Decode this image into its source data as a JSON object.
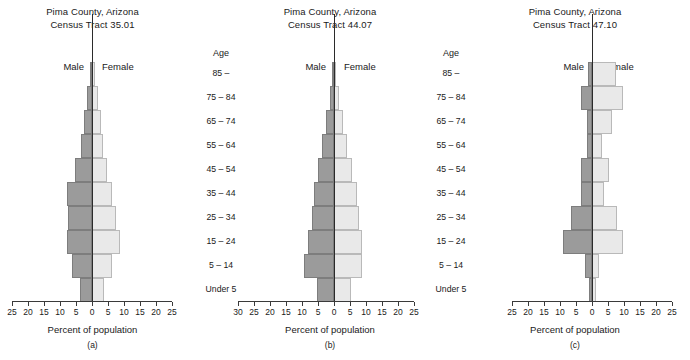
{
  "figure": {
    "axis_title": "Percent of population",
    "age_header": "Age",
    "male_label": "Male",
    "female_label": "Female",
    "age_groups": [
      "85 –",
      "75 – 84",
      "65 – 74",
      "55 – 64",
      "45 – 54",
      "35 – 44",
      "25 – 34",
      "15 – 24",
      "5 – 14",
      "Under 5"
    ],
    "colors": {
      "male_bar": "#9b9b9b",
      "female_bar": "#e9e9e9",
      "axis": "#3a3a3a",
      "text": "#1a1a1a"
    }
  },
  "panels": [
    {
      "key": "a",
      "caption": "(a)",
      "title_line1": "Pima County, Arizona",
      "title_line2": "Census Tract 35.01",
      "ticks": [
        25,
        20,
        15,
        10,
        5,
        0,
        5,
        10,
        15,
        20,
        25
      ]
    },
    {
      "key": "b",
      "caption": "(b)",
      "title_line1": "Pima County, Arizona",
      "title_line2": "Census Tract 44.07",
      "ticks": [
        30,
        25,
        20,
        15,
        10,
        5,
        0,
        5,
        10,
        15,
        20,
        25
      ]
    },
    {
      "key": "c",
      "caption": "(c)",
      "title_line1": "Pima County, Arizona",
      "title_line2": "Census Tract 47.10",
      "ticks": [
        25,
        20,
        15,
        10,
        5,
        0,
        5,
        10,
        15,
        20,
        25
      ]
    }
  ],
  "chart_data": [
    {
      "type": "bar",
      "chart_style": "population-pyramid",
      "panel": "a",
      "title": "Pima County, Arizona Census Tract 35.01",
      "xlabel": "Percent of population",
      "ylabel": "Age",
      "xlim": [
        -25,
        25
      ],
      "xticks": [
        25,
        20,
        15,
        10,
        5,
        0,
        5,
        10,
        15,
        20,
        25
      ],
      "grid": false,
      "legend": "inline labels Male (left) / Female (right)",
      "categories": [
        "85 –",
        "75 – 84",
        "65 – 74",
        "55 – 64",
        "45 – 54",
        "35 – 44",
        "25 – 34",
        "15 – 24",
        "5 – 14",
        "Under 5"
      ],
      "series": [
        {
          "name": "Male",
          "side": "left",
          "values": [
            0.6,
            1.5,
            2.6,
            3.3,
            5.4,
            7.8,
            7.6,
            7.7,
            6.1,
            3.6
          ]
        },
        {
          "name": "Female",
          "side": "right",
          "values": [
            1.0,
            1.9,
            2.8,
            3.5,
            4.6,
            6.1,
            7.6,
            8.6,
            6.2,
            3.8
          ]
        }
      ]
    },
    {
      "type": "bar",
      "chart_style": "population-pyramid",
      "panel": "b",
      "title": "Pima County, Arizona Census Tract 44.07",
      "xlabel": "Percent of population",
      "ylabel": "Age",
      "xlim": [
        -30,
        25
      ],
      "xticks": [
        30,
        25,
        20,
        15,
        10,
        5,
        0,
        5,
        10,
        15,
        20,
        25
      ],
      "grid": false,
      "legend": "inline labels Male (left) / Female (right)",
      "categories": [
        "85 –",
        "75 – 84",
        "65 – 74",
        "55 – 64",
        "45 – 54",
        "35 – 44",
        "25 – 34",
        "15 – 24",
        "5 – 14",
        "Under 5"
      ],
      "series": [
        {
          "name": "Male",
          "side": "left",
          "values": [
            0.5,
            1.3,
            2.5,
            3.7,
            5.0,
            6.4,
            6.9,
            8.1,
            9.3,
            5.2
          ]
        },
        {
          "name": "Female",
          "side": "right",
          "values": [
            0.7,
            1.6,
            2.9,
            4.2,
            5.6,
            7.2,
            7.9,
            8.7,
            8.8,
            5.4
          ]
        }
      ]
    },
    {
      "type": "bar",
      "chart_style": "population-pyramid",
      "panel": "c",
      "title": "Pima County, Arizona Census Tract 47.10",
      "xlabel": "Percent of population",
      "ylabel": "Age",
      "xlim": [
        -25,
        25
      ],
      "xticks": [
        25,
        20,
        15,
        10,
        5,
        0,
        5,
        10,
        15,
        20,
        25
      ],
      "grid": false,
      "legend": "inline labels Male (left) / Female (right)",
      "categories": [
        "85 –",
        "75 – 84",
        "65 – 74",
        "55 – 64",
        "45 – 54",
        "35 – 44",
        "25 – 34",
        "15 – 24",
        "5 – 14",
        "Under 5"
      ],
      "series": [
        {
          "name": "Male",
          "side": "left",
          "values": [
            1.3,
            3.4,
            1.6,
            1.6,
            3.5,
            3.4,
            6.6,
            9.0,
            2.1,
            1.0
          ]
        },
        {
          "name": "Female",
          "side": "right",
          "values": [
            7.5,
            9.6,
            6.4,
            3.0,
            5.2,
            3.9,
            7.8,
            9.8,
            2.3,
            1.2
          ]
        }
      ]
    }
  ]
}
